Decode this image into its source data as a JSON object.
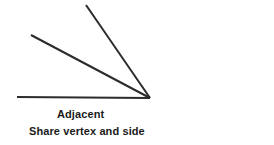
{
  "figure": {
    "background_color": "#ffffff",
    "line_color": "#2b2b2b",
    "text_color": "#1a1a1a",
    "width": 274,
    "height": 145
  },
  "geometry": {
    "vertex": {
      "x": 150,
      "y": 98
    },
    "rays": [
      {
        "name": "horizontal-ray",
        "from": {
          "x": 17,
          "y": 97
        },
        "to": {
          "x": 150,
          "y": 98
        },
        "stroke_width": 2.2
      },
      {
        "name": "middle-ray",
        "from": {
          "x": 31,
          "y": 35
        },
        "to": {
          "x": 150,
          "y": 98
        },
        "stroke_width": 2.0
      },
      {
        "name": "steep-ray",
        "from": {
          "x": 86,
          "y": 5
        },
        "to": {
          "x": 150,
          "y": 98
        },
        "stroke_width": 2.0
      }
    ]
  },
  "captions": {
    "primary": "Adjacent",
    "secondary": "Share vertex and side"
  }
}
